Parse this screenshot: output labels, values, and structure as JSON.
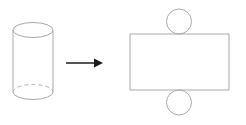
{
  "diagram": {
    "title": "Cylinder and its net",
    "background_color": "#ffffff",
    "shape_stroke_color": "#a9a9a9",
    "hidden_edge_stroke_color": "#b5b5b5",
    "arrow_color": "#1b1b1b",
    "left_figure": {
      "name": "cylinder",
      "label": "cylinder",
      "top_ellipse": {
        "center_x": 33,
        "center_y": 30,
        "radius_x": 20,
        "radius_y": 7.5,
        "style": "solid"
      },
      "bottom_ellipse": {
        "center_x": 33,
        "center_y": 92,
        "radius_x": 20,
        "radius_y": 7.5,
        "front_half_style": "solid",
        "back_half_style": "dashed"
      },
      "left_side_x": 13,
      "right_side_x": 53,
      "side_top_y": 30,
      "side_bottom_y": 92
    },
    "arrow": {
      "name": "transformation-arrow",
      "label": "unfolds to",
      "direction": "right",
      "start_x": 66,
      "end_x": 103,
      "y": 63,
      "head_width": 9,
      "head_height": 9
    },
    "right_figure": {
      "name": "cylinder-net",
      "label": "net of cylinder",
      "rectangle": {
        "name": "lateral-surface-rectangle",
        "label": "lateral surface",
        "x": 130,
        "y": 34,
        "width": 99,
        "height": 56
      },
      "top_circle": {
        "name": "top-base-circle",
        "label": "top base",
        "center_x": 179,
        "center_y": 21.5,
        "radius": 12.5
      },
      "bottom_circle": {
        "name": "bottom-base-circle",
        "label": "bottom base",
        "center_x": 179,
        "center_y": 102.5,
        "radius": 12.5
      }
    }
  }
}
